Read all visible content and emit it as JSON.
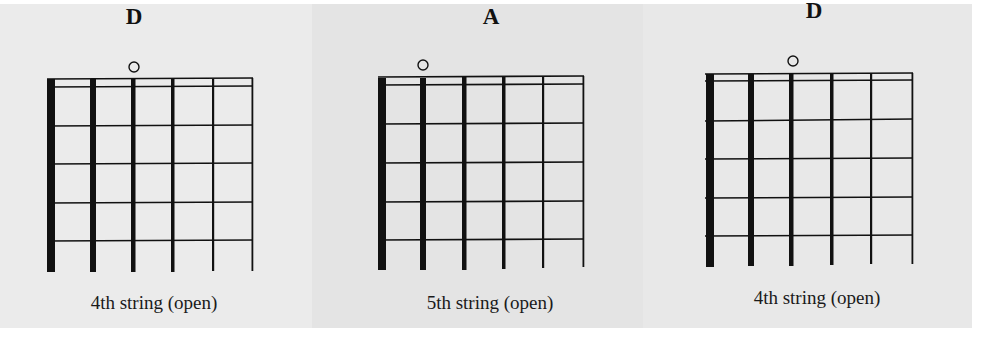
{
  "diagrams": [
    {
      "chord": "D",
      "open_marker": "o",
      "open_string": 4,
      "caption": "4th string (open)"
    },
    {
      "chord": "A",
      "open_marker": "o",
      "open_string": 5,
      "caption": "5th string (open)"
    },
    {
      "chord": "D",
      "open_marker": "o",
      "open_string": 4,
      "caption": "4th string (open)"
    }
  ],
  "fretboard": {
    "strings": 6,
    "frets": 5
  },
  "colors": {
    "panel_1_bg": "#ebebeb",
    "panel_2_bg": "#e4e4e4",
    "panel_3_bg": "#e8e8e8",
    "ink": "#111111"
  }
}
